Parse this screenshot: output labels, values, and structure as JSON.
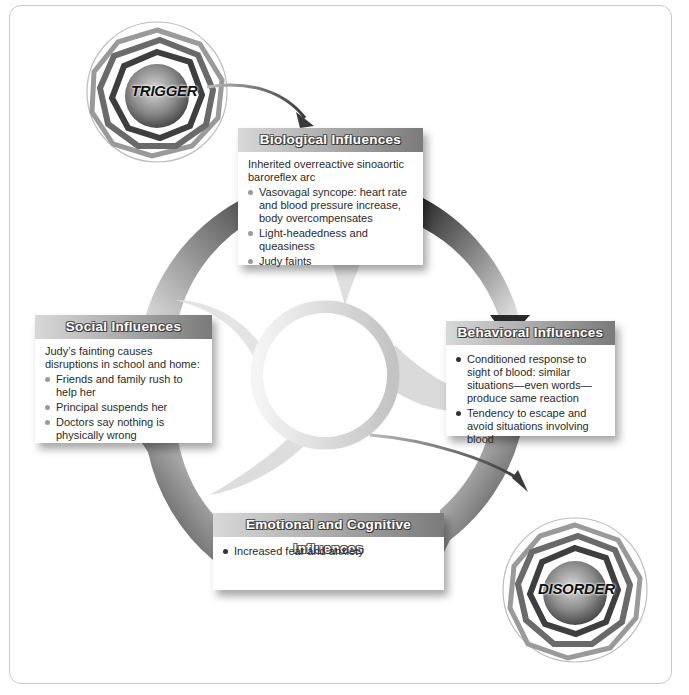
{
  "diagram": {
    "trigger_label": "TRIGGER",
    "disorder_label": "DISORDER",
    "colors": {
      "header_dark": "#7a7a7a",
      "header_light": "#d8d8d8",
      "arc_dark": "#2e2e2e",
      "arc_light": "#e6e6e6",
      "text": "#2b2b2b"
    }
  },
  "boxes": {
    "biological": {
      "title": "Biological Influences",
      "intro": "Inherited overreactive sinoaortic baroreflex arc",
      "items": [
        "Vasovagal syncope: heart rate and blood pressure increase, body overcompensates",
        "Light-headedness and queasiness",
        "Judy faints"
      ]
    },
    "social": {
      "title": "Social Influences",
      "intro": "Judy’s fainting causes disruptions in school and home:",
      "items": [
        "Friends and family rush to help her",
        "Principal suspends her",
        "Doctors say nothing is physically wrong"
      ]
    },
    "behavioral": {
      "title": "Behavioral Influences",
      "items": [
        "Conditioned response to sight of blood: similar situations—even words—produce same reaction",
        "Tendency to escape and avoid situations involving blood"
      ]
    },
    "emotional": {
      "title": "Emotional and Cognitive Influences",
      "items": [
        "Increased fear and anxiety"
      ]
    }
  }
}
